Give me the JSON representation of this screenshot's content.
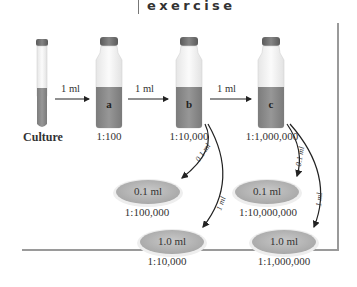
{
  "header": {
    "title": "exercise"
  },
  "vessels": [
    {
      "id": "culture",
      "label": "Culture",
      "letter": ""
    },
    {
      "id": "a",
      "label": "1:100",
      "letter": "a"
    },
    {
      "id": "b",
      "label": "1:10,000",
      "letter": "b"
    },
    {
      "id": "c",
      "label": "1:1,000,000",
      "letter": "c"
    }
  ],
  "transfers": [
    {
      "from": "culture",
      "to": "a",
      "label": "1 ml"
    },
    {
      "from": "a",
      "to": "b",
      "label": "1 ml"
    },
    {
      "from": "b",
      "to": "c",
      "label": "1 ml"
    }
  ],
  "plating_arrows": [
    {
      "from": "b",
      "label": "0.1 ml"
    },
    {
      "from": "b",
      "label": "1 ml"
    },
    {
      "from": "c",
      "label": "0.1 ml"
    },
    {
      "from": "c",
      "label": "1 ml"
    }
  ],
  "plates": [
    {
      "volume": "0.1 ml",
      "dilution": "1:100,000"
    },
    {
      "volume": "1.0 ml",
      "dilution": "1:10,000"
    },
    {
      "volume": "0.1 ml",
      "dilution": "1:10,000,000"
    },
    {
      "volume": "1.0 ml",
      "dilution": "1:1,000,000"
    }
  ],
  "colors": {
    "liquid": "#8a8a8a",
    "cap": "#6e6e6e",
    "glass": "#f2f2f2",
    "plate": "#b8b8b8"
  }
}
